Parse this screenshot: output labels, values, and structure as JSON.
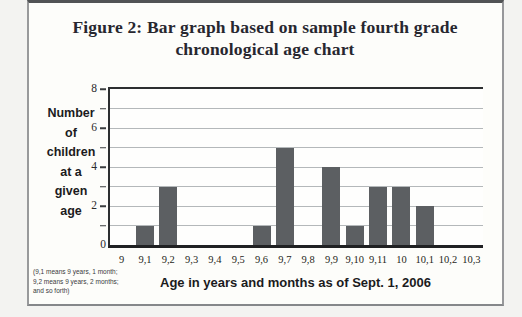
{
  "figure": {
    "title_line1": "Figure 2: Bar graph based on sample fourth grade",
    "title_line2": "chronological age chart"
  },
  "chart_data": {
    "type": "bar",
    "title": "Figure 2: Bar graph based on sample fourth grade chronological age chart",
    "categories": [
      "9",
      "9,1",
      "9,2",
      "9,3",
      "9,4",
      "9,5",
      "9,6",
      "9,7",
      "9,8",
      "9,9",
      "9,10",
      "9,11",
      "10",
      "10,1",
      "10,2",
      "10,3"
    ],
    "values": [
      0,
      1,
      3,
      0,
      0,
      0,
      1,
      5,
      0,
      4,
      1,
      3,
      3,
      2,
      0,
      0
    ],
    "xlabel": "Age in years and months as of Sept. 1, 2006",
    "ylabel_lines": [
      "Number",
      "of",
      "children",
      "at a",
      "given",
      "age"
    ],
    "ylim": [
      0,
      8
    ],
    "yticks_major": [
      8,
      6,
      4,
      2,
      0
    ],
    "yticks_minor": [
      7,
      5,
      3,
      1
    ],
    "grid": "horizontal",
    "legend": "none",
    "bar_color": "#5c5f62",
    "footnote_lines": [
      "(9,1 means 9 years, 1 month;",
      "9,2 means 9 years, 2 months;",
      "and so forth)"
    ]
  }
}
